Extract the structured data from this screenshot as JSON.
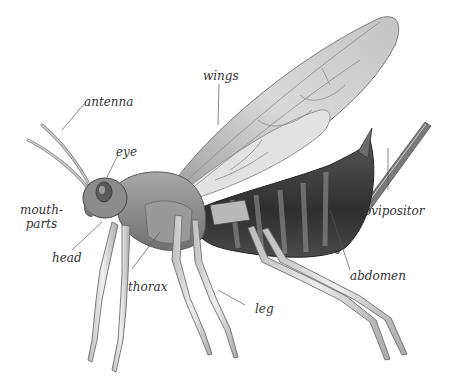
{
  "diagram": {
    "labels": {
      "antenna": "antenna",
      "wings": "wings",
      "eye": "eye",
      "mouthparts_line1": "mouth-",
      "mouthparts_line2": "parts",
      "head": "head",
      "thorax": "thorax",
      "leg": "leg",
      "ovipositor": "ovipositor",
      "abdomen": "abdomen"
    },
    "colors": {
      "background": "#ffffff",
      "ink": "#333333",
      "body_dark": "#3a3a3a",
      "body_mid": "#8a8a8a",
      "wing": "#d6d6d6",
      "leg": "#c8c8c8"
    }
  }
}
